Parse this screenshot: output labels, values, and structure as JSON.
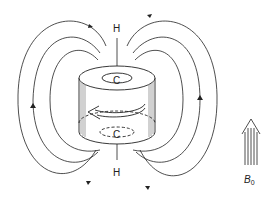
{
  "diagram": {
    "type": "magnetic field lines around a ring current (induced diamagnetic shielding)",
    "labels": {
      "top_atom": "H",
      "bottom_atom": "H",
      "top_ring_center": "C",
      "bottom_ring_center": "C",
      "field_symbol": "B",
      "field_subscript": "0"
    },
    "elements": [
      "cylinder with circulating current arrow",
      "vertical H–C–C–H axis",
      "closed magnetic field lines, 3 on each side with arrowheads",
      "applied field arrow B0 pointing up"
    ],
    "colors": {
      "line": "#222222",
      "background": "#ffffff"
    }
  }
}
